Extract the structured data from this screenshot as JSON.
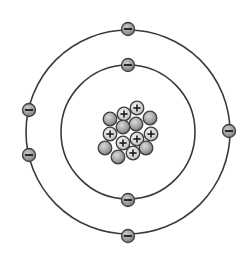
{
  "diagram": {
    "title": "Bohr model of an atom",
    "center": [
      128,
      132
    ],
    "colors": {
      "orbit": "#3a3a3a",
      "particle_stroke": "#3d3d3d",
      "proton_fill": "#d6d6d6",
      "neutron_fill": "#a9a9a9",
      "electron_fill": "#9a9a9a",
      "sign": "#1a1a1a",
      "background": "#ffffff"
    },
    "shells": [
      {
        "name": "inner-shell",
        "radius": 67,
        "electrons": [
          {
            "x": 128,
            "y": 65,
            "symbol": "−"
          },
          {
            "x": 128,
            "y": 200,
            "symbol": "−"
          }
        ]
      },
      {
        "name": "outer-shell",
        "radius": 102,
        "electrons": [
          {
            "x": 128,
            "y": 29,
            "symbol": "−"
          },
          {
            "x": 29,
            "y": 110,
            "symbol": "−"
          },
          {
            "x": 29,
            "y": 155,
            "symbol": "−"
          },
          {
            "x": 229,
            "y": 131,
            "symbol": "−"
          },
          {
            "x": 128,
            "y": 236,
            "symbol": "−"
          }
        ]
      }
    ],
    "nucleus": {
      "protons": [
        {
          "x": 124,
          "y": 114,
          "symbol": "+"
        },
        {
          "x": 137,
          "y": 108,
          "symbol": "+"
        },
        {
          "x": 110,
          "y": 134,
          "symbol": "+"
        },
        {
          "x": 123,
          "y": 143,
          "symbol": "+"
        },
        {
          "x": 137,
          "y": 139,
          "symbol": "+"
        },
        {
          "x": 151,
          "y": 134,
          "symbol": "+"
        },
        {
          "x": 133,
          "y": 153,
          "symbol": "+"
        }
      ],
      "neutrons": [
        {
          "x": 110,
          "y": 119
        },
        {
          "x": 150,
          "y": 118
        },
        {
          "x": 123,
          "y": 127
        },
        {
          "x": 136,
          "y": 124
        },
        {
          "x": 105,
          "y": 148
        },
        {
          "x": 118,
          "y": 157
        },
        {
          "x": 146,
          "y": 148
        }
      ]
    },
    "counts": {
      "protons": 7,
      "neutrons": 7,
      "electrons": 7
    }
  }
}
